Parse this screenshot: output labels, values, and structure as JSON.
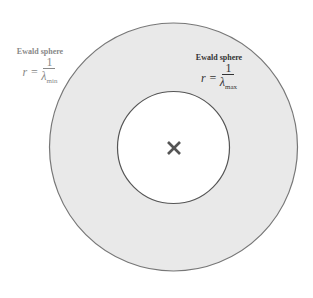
{
  "diagram": {
    "outer_circle": {
      "cx": 173.5,
      "cy": 147,
      "r": 124,
      "fill": "#e9e9e9",
      "stroke": "#777777"
    },
    "inner_circle": {
      "cx": 173.5,
      "cy": 147.5,
      "r": 56,
      "fill": "#ffffff",
      "stroke": "#555555"
    },
    "center_marker": {
      "symbol": "×",
      "x": 174,
      "y": 148,
      "color": "#555555"
    }
  },
  "labels": {
    "min": {
      "title": "Ewald sphere",
      "lhs": "r =",
      "numerator": "1",
      "lambda": "λ",
      "subscript": "min",
      "color": "#888888"
    },
    "max": {
      "title": "Ewald sphere",
      "lhs": "r =",
      "numerator": "1",
      "lambda": "λ",
      "subscript": "max",
      "color": "#333333"
    }
  }
}
